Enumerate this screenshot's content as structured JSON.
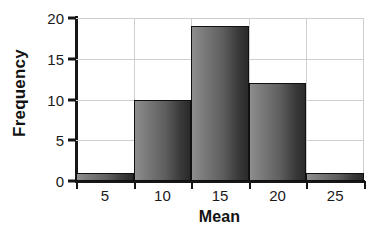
{
  "chart_data": {
    "type": "bar",
    "title": "",
    "subtitle": "",
    "xlabel": "Mean",
    "ylabel": "Frequency",
    "categories": [
      "5",
      "10",
      "15",
      "20",
      "25"
    ],
    "values": [
      1,
      10,
      19,
      12,
      1
    ],
    "bin_edges": [
      2.5,
      7.5,
      12.5,
      17.5,
      22.5,
      27.5
    ],
    "bin_centers": [
      5,
      10,
      15,
      20,
      25
    ],
    "xlim": [
      2.5,
      27.5
    ],
    "ylim": [
      0,
      20
    ],
    "y_ticks": [
      "0",
      "5",
      "10",
      "15",
      "20"
    ],
    "y_tick_values": [
      0,
      5,
      10,
      15,
      20
    ],
    "x_ticks": [
      "5",
      "10",
      "15",
      "20",
      "25"
    ],
    "x_tick_values": [
      5,
      10,
      15,
      20,
      25
    ],
    "grid": "horizontal",
    "legend": "none",
    "bar_color": "#5e5e5e",
    "bar_edge_color": "#101010",
    "grid_color": "#cfcfcf",
    "axis_color": "#161616",
    "background": "#ffffff",
    "annotations": []
  }
}
